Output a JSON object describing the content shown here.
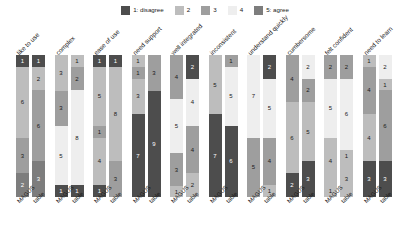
{
  "chart_data": {
    "type": "bar",
    "title": "",
    "subtitle": "",
    "xlabel": "",
    "ylabel": "",
    "grid": false,
    "stacked": true,
    "normalized": false,
    "legend_position": "top-center",
    "legend": [
      {
        "key": "1",
        "label": "1: disagree",
        "color": "#4d4d4d"
      },
      {
        "key": "2",
        "label": "2",
        "color": "#bdbdbd"
      },
      {
        "key": "3",
        "label": "3",
        "color": "#9e9e9e"
      },
      {
        "key": "4",
        "label": "4",
        "color": "#eeeeee"
      },
      {
        "key": "5",
        "label": "5: agree",
        "color": "#7d7d7d"
      }
    ],
    "categories": [
      "like to use",
      "complex",
      "ease of use",
      "need support",
      "well integrated",
      "inconsistent",
      "understand quickly",
      "cumbersome",
      "felt confident",
      "need to learn"
    ],
    "group_ticks": [
      "MAGUS",
      "table"
    ],
    "ylim": [
      0,
      12
    ],
    "groups": [
      {
        "category": "like to use",
        "bars": [
          {
            "name": "MAGUS",
            "segments": [
              {
                "level": "1",
                "value": 1
              },
              {
                "level": "2",
                "value": 6
              },
              {
                "level": "3",
                "value": 3
              },
              {
                "level": "5",
                "value": 2
              }
            ]
          },
          {
            "name": "table",
            "segments": [
              {
                "level": "1",
                "value": 1
              },
              {
                "level": "2",
                "value": 2
              },
              {
                "level": "3",
                "value": 6
              },
              {
                "level": "5",
                "value": 3
              }
            ]
          }
        ]
      },
      {
        "category": "complex",
        "bars": [
          {
            "name": "MAGUS",
            "segments": [
              {
                "level": "2",
                "value": 3
              },
              {
                "level": "3",
                "value": 3
              },
              {
                "level": "4",
                "value": 5
              },
              {
                "level": "1",
                "value": 1
              }
            ]
          },
          {
            "name": "table",
            "segments": [
              {
                "level": "2",
                "value": 1
              },
              {
                "level": "3",
                "value": 2
              },
              {
                "level": "4",
                "value": 8
              },
              {
                "level": "1",
                "value": 1
              }
            ]
          }
        ]
      },
      {
        "category": "ease of use",
        "bars": [
          {
            "name": "MAGUS",
            "segments": [
              {
                "level": "1",
                "value": 1
              },
              {
                "level": "2",
                "value": 5
              },
              {
                "level": "3",
                "value": 1
              },
              {
                "level": "2",
                "value": 4
              },
              {
                "level": "1",
                "value": 1
              }
            ]
          },
          {
            "name": "table",
            "segments": [
              {
                "level": "1",
                "value": 1
              },
              {
                "level": "2",
                "value": 8
              },
              {
                "level": "3",
                "value": 3
              }
            ]
          }
        ]
      },
      {
        "category": "need support",
        "bars": [
          {
            "name": "MAGUS",
            "segments": [
              {
                "level": "2",
                "value": 1
              },
              {
                "level": "3",
                "value": 1
              },
              {
                "level": "2",
                "value": 3
              },
              {
                "level": "1",
                "value": 7
              }
            ]
          },
          {
            "name": "table",
            "segments": [
              {
                "level": "3",
                "value": 3
              },
              {
                "level": "1",
                "value": 9
              }
            ]
          }
        ]
      },
      {
        "category": "well integrated",
        "bars": [
          {
            "name": "MAGUS",
            "segments": [
              {
                "level": "3",
                "value": 4
              },
              {
                "level": "4",
                "value": 5
              },
              {
                "level": "3",
                "value": 3
              },
              {
                "level": "2",
                "value": 1
              }
            ]
          },
          {
            "name": "table",
            "segments": [
              {
                "level": "1",
                "value": 2
              },
              {
                "level": "4",
                "value": 4
              },
              {
                "level": "3",
                "value": 4
              },
              {
                "level": "2",
                "value": 2
              }
            ]
          }
        ]
      },
      {
        "category": "inconsistent",
        "bars": [
          {
            "name": "MAGUS",
            "segments": [
              {
                "level": "2",
                "value": 5
              },
              {
                "level": "1",
                "value": 7
              }
            ]
          },
          {
            "name": "table",
            "segments": [
              {
                "level": "3",
                "value": 1
              },
              {
                "level": "4",
                "value": 5
              },
              {
                "level": "1",
                "value": 6
              }
            ]
          }
        ]
      },
      {
        "category": "understand quickly",
        "bars": [
          {
            "name": "MAGUS",
            "segments": [
              {
                "level": "4",
                "value": 7
              },
              {
                "level": "3",
                "value": 5
              }
            ]
          },
          {
            "name": "table",
            "segments": [
              {
                "level": "1",
                "value": 2
              },
              {
                "level": "4",
                "value": 5
              },
              {
                "level": "3",
                "value": 4
              },
              {
                "level": "2",
                "value": 1
              }
            ]
          }
        ]
      },
      {
        "category": "cumbersome",
        "bars": [
          {
            "name": "MAGUS",
            "segments": [
              {
                "level": "3",
                "value": 4
              },
              {
                "level": "2",
                "value": 6
              },
              {
                "level": "1",
                "value": 2
              }
            ]
          },
          {
            "name": "table",
            "segments": [
              {
                "level": "4",
                "value": 2
              },
              {
                "level": "3",
                "value": 2
              },
              {
                "level": "2",
                "value": 5
              },
              {
                "level": "1",
                "value": 3
              }
            ]
          }
        ]
      },
      {
        "category": "felt confident",
        "bars": [
          {
            "name": "MAGUS",
            "segments": [
              {
                "level": "3",
                "value": 2
              },
              {
                "level": "4",
                "value": 5
              },
              {
                "level": "2",
                "value": 4
              },
              {
                "level": "2",
                "value": 1
              }
            ]
          },
          {
            "name": "table",
            "segments": [
              {
                "level": "3",
                "value": 2
              },
              {
                "level": "4",
                "value": 6
              },
              {
                "level": "2",
                "value": 1
              },
              {
                "level": "2",
                "value": 3
              }
            ]
          }
        ]
      },
      {
        "category": "need to learn",
        "bars": [
          {
            "name": "MAGUS",
            "segments": [
              {
                "level": "2",
                "value": 1
              },
              {
                "level": "3",
                "value": 4
              },
              {
                "level": "2",
                "value": 4
              },
              {
                "level": "1",
                "value": 3
              }
            ]
          },
          {
            "name": "table",
            "segments": [
              {
                "level": "4",
                "value": 2
              },
              {
                "level": "2",
                "value": 1
              },
              {
                "level": "3",
                "value": 6
              },
              {
                "level": "1",
                "value": 3
              }
            ]
          }
        ]
      }
    ]
  }
}
